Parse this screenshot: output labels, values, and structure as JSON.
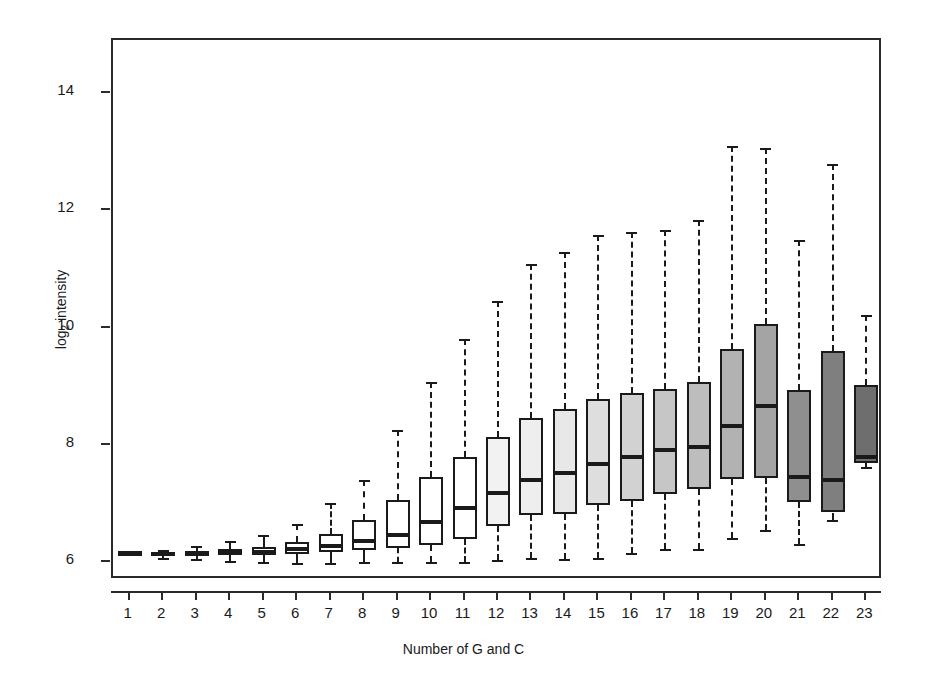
{
  "chart_data": {
    "type": "box",
    "title": "",
    "xlabel": "Number of G and C",
    "ylabel": "log2 intensity",
    "ylabel_html": "log<sub>2</sub> intensity",
    "xlim": [
      0.5,
      23.5
    ],
    "ylim": [
      5.7,
      14.9
    ],
    "grid": false,
    "legend": "none",
    "y_ticks": [
      6,
      8,
      10,
      12,
      14
    ],
    "y_tick_labels": [
      "6",
      "8",
      "10",
      "12",
      "14"
    ],
    "categories": [
      "1",
      "2",
      "3",
      "4",
      "5",
      "6",
      "7",
      "8",
      "9",
      "10",
      "11",
      "12",
      "13",
      "14",
      "15",
      "16",
      "17",
      "18",
      "19",
      "20",
      "21",
      "22",
      "23"
    ],
    "box_fill_colors": [
      "#ffffff",
      "#ffffff",
      "#ffffff",
      "#ffffff",
      "#ffffff",
      "#ffffff",
      "#ffffff",
      "#ffffff",
      "#ffffff",
      "#ffffff",
      "#ffffff",
      "#f2f2f2",
      "#eeeeee",
      "#e8e8e8",
      "#dedede",
      "#d2d2d2",
      "#c6c6c6",
      "#bdbdbd",
      "#b2b2b2",
      "#a4a4a4",
      "#8f8f8f",
      "#7f7f7f",
      "#6e6e6e"
    ],
    "line_color": "#1a1a1a",
    "frame_color": "#2b2b2b",
    "boxes": [
      {
        "category": "1",
        "whisker_low": 6.14,
        "q1": 6.15,
        "median": 6.16,
        "q3": 6.18,
        "whisker_high": 6.19
      },
      {
        "category": "2",
        "whisker_low": 6.08,
        "q1": 6.12,
        "median": 6.14,
        "q3": 6.17,
        "whisker_high": 6.21
      },
      {
        "category": "3",
        "whisker_low": 6.05,
        "q1": 6.12,
        "median": 6.15,
        "q3": 6.19,
        "whisker_high": 6.28
      },
      {
        "category": "4",
        "whisker_low": 6.02,
        "q1": 6.13,
        "median": 6.17,
        "q3": 6.22,
        "whisker_high": 6.36
      },
      {
        "category": "5",
        "whisker_low": 6.0,
        "q1": 6.13,
        "median": 6.18,
        "q3": 6.26,
        "whisker_high": 6.47
      },
      {
        "category": "6",
        "whisker_low": 5.99,
        "q1": 6.15,
        "median": 6.22,
        "q3": 6.35,
        "whisker_high": 6.66
      },
      {
        "category": "7",
        "whisker_low": 5.99,
        "q1": 6.17,
        "median": 6.28,
        "q3": 6.49,
        "whisker_high": 7.02
      },
      {
        "category": "8",
        "whisker_low": 6.0,
        "q1": 6.21,
        "median": 6.36,
        "q3": 6.73,
        "whisker_high": 7.4
      },
      {
        "category": "9",
        "whisker_low": 6.0,
        "q1": 6.25,
        "median": 6.47,
        "q3": 7.07,
        "whisker_high": 8.25
      },
      {
        "category": "10",
        "whisker_low": 6.0,
        "q1": 6.3,
        "median": 6.68,
        "q3": 7.45,
        "whisker_high": 9.08
      },
      {
        "category": "11",
        "whisker_low": 6.01,
        "q1": 6.4,
        "median": 6.93,
        "q3": 7.8,
        "whisker_high": 9.81
      },
      {
        "category": "12",
        "whisker_low": 6.04,
        "q1": 6.62,
        "median": 7.18,
        "q3": 8.14,
        "whisker_high": 10.45
      },
      {
        "category": "13",
        "whisker_low": 6.08,
        "q1": 6.81,
        "median": 7.4,
        "q3": 8.46,
        "whisker_high": 11.09
      },
      {
        "category": "14",
        "whisker_low": 6.05,
        "q1": 6.83,
        "median": 7.53,
        "q3": 8.62,
        "whisker_high": 11.28
      },
      {
        "category": "15",
        "whisker_low": 6.07,
        "q1": 6.97,
        "median": 7.68,
        "q3": 8.78,
        "whisker_high": 11.58
      },
      {
        "category": "16",
        "whisker_low": 6.16,
        "q1": 7.05,
        "median": 7.8,
        "q3": 8.88,
        "whisker_high": 11.63
      },
      {
        "category": "17",
        "whisker_low": 6.22,
        "q1": 7.16,
        "median": 7.91,
        "q3": 8.95,
        "whisker_high": 11.66
      },
      {
        "category": "18",
        "whisker_low": 6.23,
        "q1": 7.25,
        "median": 7.97,
        "q3": 9.08,
        "whisker_high": 11.83
      },
      {
        "category": "19",
        "whisker_low": 6.42,
        "q1": 7.42,
        "median": 8.33,
        "q3": 9.64,
        "whisker_high": 13.1
      },
      {
        "category": "20",
        "whisker_low": 6.56,
        "q1": 7.43,
        "median": 8.67,
        "q3": 10.06,
        "whisker_high": 13.06
      },
      {
        "category": "21",
        "whisker_low": 6.32,
        "q1": 7.03,
        "median": 7.46,
        "q3": 8.94,
        "whisker_high": 11.5
      },
      {
        "category": "22",
        "whisker_low": 6.73,
        "q1": 6.85,
        "median": 7.41,
        "q3": 9.6,
        "whisker_high": 12.78
      },
      {
        "category": "23",
        "whisker_low": 7.62,
        "q1": 7.69,
        "median": 7.8,
        "q3": 9.02,
        "whisker_high": 10.22
      }
    ]
  }
}
